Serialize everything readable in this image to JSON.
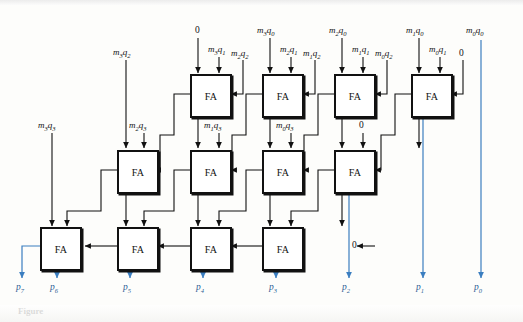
{
  "figure": {
    "caption": "Figure",
    "fa_label": "FA",
    "wire_color_black": "#111111",
    "wire_color_blue": "#3b7ec0",
    "box_border_color": "#111111",
    "background": "#fdfdfb"
  },
  "adders": [
    {
      "id": "r1c1",
      "label": "FA",
      "row": 1,
      "col": 1
    },
    {
      "id": "r1c2",
      "label": "FA",
      "row": 1,
      "col": 2
    },
    {
      "id": "r1c3",
      "label": "FA",
      "row": 1,
      "col": 3
    },
    {
      "id": "r1c4",
      "label": "FA",
      "row": 1,
      "col": 4
    },
    {
      "id": "r2c1",
      "label": "FA",
      "row": 2,
      "col": 1
    },
    {
      "id": "r2c2",
      "label": "FA",
      "row": 2,
      "col": 2
    },
    {
      "id": "r2c3",
      "label": "FA",
      "row": 2,
      "col": 3
    },
    {
      "id": "r2c4",
      "label": "FA",
      "row": 2,
      "col": 4
    },
    {
      "id": "r3c1",
      "label": "FA",
      "row": 3,
      "col": 1
    },
    {
      "id": "r3c2",
      "label": "FA",
      "row": 3,
      "col": 2
    },
    {
      "id": "r3c3",
      "label": "FA",
      "row": 3,
      "col": 3
    },
    {
      "id": "r3c4",
      "label": "FA",
      "row": 3,
      "col": 4
    }
  ],
  "input_labels": {
    "row1": {
      "c1_a": "0",
      "c1_b_m": "m",
      "c1_b_msub": "3",
      "c1_b_q": "q",
      "c1_b_qsub": "1",
      "c1_c_m": "m",
      "c1_c_msub": "2",
      "c1_c_q": "q",
      "c1_c_qsub": "2",
      "c2_a_m": "m",
      "c2_a_msub": "3",
      "c2_a_q": "q",
      "c2_a_qsub": "0",
      "c2_b_m": "m",
      "c2_b_msub": "2",
      "c2_b_q": "q",
      "c2_b_qsub": "1",
      "c2_c_m": "m",
      "c2_c_msub": "1",
      "c2_c_q": "q",
      "c2_c_qsub": "2",
      "c3_a_m": "m",
      "c3_a_msub": "2",
      "c3_a_q": "q",
      "c3_a_qsub": "0",
      "c3_b_m": "m",
      "c3_b_msub": "1",
      "c3_b_q": "q",
      "c3_b_qsub": "1",
      "c3_c_m": "m",
      "c3_c_msub": "0",
      "c3_c_q": "q",
      "c3_c_qsub": "2",
      "c4_a_m": "m",
      "c4_a_msub": "1",
      "c4_a_q": "q",
      "c4_a_qsub": "0",
      "c4_b_m": "m",
      "c4_b_msub": "0",
      "c4_b_q": "q",
      "c4_b_qsub": "1",
      "c4_c": "0",
      "direct_m": "m",
      "direct_msub": "0",
      "direct_q": "q",
      "direct_qsub": "0"
    },
    "row2": {
      "c1_a_m": "m",
      "c1_a_msub": "3",
      "c1_a_q": "q",
      "c1_a_qsub": "2",
      "c1_b_m": "m",
      "c1_b_msub": "2",
      "c1_b_q": "q",
      "c1_b_qsub": "3",
      "c2_b_m": "m",
      "c2_b_msub": "1",
      "c2_b_q": "q",
      "c2_b_qsub": "3",
      "c3_b_m": "m",
      "c3_b_msub": "0",
      "c3_b_q": "q",
      "c3_b_qsub": "3",
      "c4_b": "0"
    },
    "row3": {
      "c1_a_m": "m",
      "c1_a_msub": "3",
      "c1_a_q": "q",
      "c1_a_qsub": "3",
      "carry_in": "0"
    }
  },
  "outputs": [
    {
      "name": "p7",
      "p": "p",
      "sub": "7"
    },
    {
      "name": "p6",
      "p": "p",
      "sub": "6"
    },
    {
      "name": "p5",
      "p": "p",
      "sub": "5"
    },
    {
      "name": "p4",
      "p": "p",
      "sub": "4"
    },
    {
      "name": "p3",
      "p": "p",
      "sub": "3"
    },
    {
      "name": "p2",
      "p": "p",
      "sub": "2"
    },
    {
      "name": "p1",
      "p": "p",
      "sub": "1"
    },
    {
      "name": "p0",
      "p": "p",
      "sub": "0"
    }
  ]
}
